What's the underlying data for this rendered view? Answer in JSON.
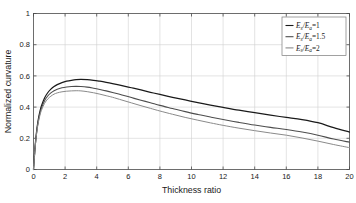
{
  "chart_data": {
    "type": "line",
    "title": "",
    "xlabel": "Thickness ratio",
    "ylabel": "Normalized curvature",
    "xlim": [
      0,
      20
    ],
    "ylim": [
      0,
      1
    ],
    "xticks": [
      0,
      2,
      4,
      6,
      8,
      10,
      12,
      14,
      16,
      18,
      20
    ],
    "xticklabels": [
      "0",
      "2",
      "4",
      "6",
      "8",
      "10",
      "12",
      "14",
      "16",
      "18",
      "20"
    ],
    "yticks": [
      0,
      0.2,
      0.4,
      0.6,
      0.8,
      1
    ],
    "yticklabels": [
      "0",
      "0.2",
      "0.4",
      "0.6",
      "0.8",
      "1"
    ],
    "grid": true,
    "legend_position": "top-right",
    "x": [
      0,
      0.1,
      0.2,
      0.3,
      0.4,
      0.5,
      0.7,
      0.9,
      1.1,
      1.3,
      1.5,
      1.8,
      2.1,
      2.4,
      2.7,
      3.0,
      3.4,
      3.8,
      4.2,
      4.6,
      5.0,
      5.6,
      6.2,
      6.8,
      7.4,
      8.0,
      8.8,
      9.6,
      10.4,
      11.2,
      12.0,
      13.0,
      14.0,
      15.0,
      16.0,
      17.0,
      18.0,
      19.0,
      20.0
    ],
    "series": [
      {
        "name": "Es/Ea=1",
        "label_num": "E",
        "label_sub1": "s",
        "label_den": "E",
        "label_sub2": "a",
        "label_value": "1",
        "color": "#1a1a1a",
        "width": 1.25,
        "values": [
          0.0,
          0.145,
          0.248,
          0.318,
          0.369,
          0.407,
          0.459,
          0.492,
          0.515,
          0.532,
          0.544,
          0.557,
          0.566,
          0.572,
          0.576,
          0.577,
          0.576,
          0.572,
          0.566,
          0.559,
          0.551,
          0.538,
          0.524,
          0.51,
          0.495,
          0.481,
          0.463,
          0.446,
          0.429,
          0.413,
          0.398,
          0.38,
          0.364,
          0.348,
          0.334,
          0.32,
          0.3,
          0.268,
          0.24
        ]
      },
      {
        "name": "Es/Ea=1.5",
        "label_num": "E",
        "label_sub1": "s",
        "label_den": "E",
        "label_sub2": "a",
        "label_value": "1.5",
        "color": "#4d4d4d",
        "width": 1.1,
        "values": [
          0.0,
          0.14,
          0.24,
          0.308,
          0.357,
          0.393,
          0.441,
          0.471,
          0.491,
          0.505,
          0.515,
          0.524,
          0.529,
          0.532,
          0.533,
          0.532,
          0.528,
          0.521,
          0.513,
          0.504,
          0.494,
          0.478,
          0.461,
          0.444,
          0.428,
          0.411,
          0.391,
          0.371,
          0.353,
          0.336,
          0.32,
          0.302,
          0.285,
          0.27,
          0.256,
          0.24,
          0.22,
          0.195,
          0.175
        ]
      },
      {
        "name": "Es/Ea=2",
        "label_num": "E",
        "label_sub1": "s",
        "label_den": "E",
        "label_sub2": "a",
        "label_value": "2",
        "color": "#8a8a8a",
        "width": 1.0,
        "values": [
          0.0,
          0.136,
          0.233,
          0.298,
          0.345,
          0.379,
          0.424,
          0.452,
          0.47,
          0.483,
          0.491,
          0.498,
          0.502,
          0.504,
          0.505,
          0.504,
          0.499,
          0.492,
          0.483,
          0.473,
          0.463,
          0.445,
          0.427,
          0.409,
          0.392,
          0.375,
          0.354,
          0.334,
          0.316,
          0.299,
          0.283,
          0.265,
          0.249,
          0.234,
          0.22,
          0.202,
          0.182,
          0.16,
          0.14
        ]
      }
    ]
  }
}
